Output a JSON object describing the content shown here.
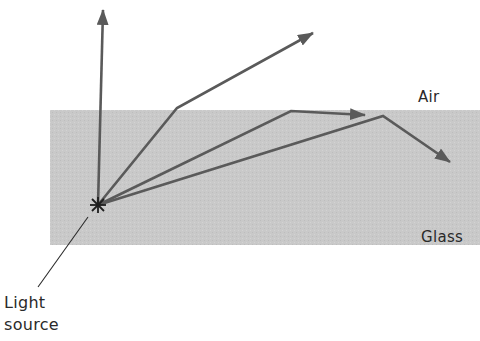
{
  "diagram": {
    "title": "",
    "colors": {
      "background": "#ffffff",
      "glass": "#c9c9c9",
      "ray": "#5a5a5a",
      "text": "#2a2a2a"
    },
    "media": [
      {
        "name": "Air",
        "region": "top"
      },
      {
        "name": "Glass",
        "region": "bottom"
      }
    ],
    "labels": {
      "air": "Air",
      "glass": "Glass",
      "light_line1": "Light",
      "light_line2": "source"
    },
    "light_source": {
      "x": 98,
      "y": 205
    },
    "rays": [
      {
        "id": "normal",
        "points": [
          [
            98,
            205
          ],
          [
            103,
            8
          ]
        ],
        "description": "Ray along normal, passes straight through"
      },
      {
        "id": "refracted",
        "points": [
          [
            98,
            205
          ],
          [
            177,
            108
          ],
          [
            313,
            33
          ]
        ],
        "description": "Ray refracted away from normal on exiting glass"
      },
      {
        "id": "critical",
        "points": [
          [
            98,
            205
          ],
          [
            291,
            111
          ],
          [
            365,
            115
          ]
        ],
        "description": "Ray at critical angle, travels along surface"
      },
      {
        "id": "total-internal-reflection",
        "points": [
          [
            98,
            205
          ],
          [
            383,
            116
          ],
          [
            450,
            162
          ]
        ],
        "description": "Ray totally internally reflected"
      }
    ]
  }
}
